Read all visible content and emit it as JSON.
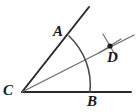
{
  "figure": {
    "kind": "geometry-diagram",
    "background_color": "#ffffff",
    "stroke_dark": "#2b2b2b",
    "stroke_mid": "#6e6e6e",
    "stroke_light": "#8a8a8a",
    "point_color": "#1a1a1a"
  },
  "labels": {
    "vertex": "C",
    "point_a": "A",
    "point_b": "B",
    "point_d": "D"
  },
  "chart_data": {
    "type": "scatter",
    "title": "",
    "xlabel": "",
    "ylabel": "",
    "grid": false,
    "legend": null,
    "points": [
      {
        "name": "C",
        "x": 22,
        "y": 92,
        "label": "C",
        "marked": false
      },
      {
        "name": "A",
        "x": 69,
        "y": 36,
        "label": "A",
        "marked": false
      },
      {
        "name": "B",
        "x": 90,
        "y": 92,
        "label": "B",
        "marked": false
      },
      {
        "name": "D",
        "x": 110,
        "y": 46,
        "label": "D",
        "marked": true
      }
    ],
    "segments": [
      {
        "name": "ray-CA",
        "from": [
          22,
          92
        ],
        "to": [
          89,
          7
        ],
        "weight": 2.0,
        "color": "#2b2b2b"
      },
      {
        "name": "ray-CB",
        "from": [
          22,
          92
        ],
        "to": [
          131,
          92
        ],
        "weight": 2.0,
        "color": "#2b2b2b"
      },
      {
        "name": "ray-CD",
        "from": [
          22,
          92
        ],
        "to": [
          134,
          35
        ],
        "weight": 1.4,
        "color": "#6e6e6e"
      },
      {
        "name": "arc-mark-1",
        "from": [
          99,
          53
        ],
        "to": [
          121,
          39
        ],
        "weight": 1.2,
        "color": "#6e6e6e"
      },
      {
        "name": "arc-mark-2",
        "from": [
          103,
          34
        ],
        "to": [
          117,
          58
        ],
        "weight": 1.2,
        "color": "#6e6e6e"
      }
    ],
    "arcs": [
      {
        "name": "arc-AB",
        "center": [
          22,
          92
        ],
        "radius": 68,
        "start_point": [
          69,
          36
        ],
        "end_point": [
          90,
          92
        ],
        "weight": 1.6,
        "color": "#4a4a4a"
      }
    ]
  }
}
